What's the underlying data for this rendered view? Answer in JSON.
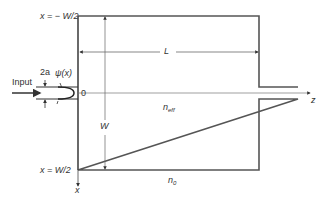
{
  "diagram": {
    "type": "multimode-interference waveguide schematic",
    "labels": {
      "top_boundary": "x = − W/2",
      "bottom_boundary": "x = W/2",
      "length": "L",
      "width": "W",
      "input": "Input",
      "half_width": "2a",
      "field": "ψ(x)",
      "origin": "0",
      "z_axis": "z",
      "x_axis": "x",
      "n_eff_base": "n",
      "n_eff_sub": "eff",
      "n0_base": "n",
      "n0_sub": "0"
    },
    "colors": {
      "line": "#333333",
      "axis": "#666666",
      "text": "#333333"
    }
  }
}
